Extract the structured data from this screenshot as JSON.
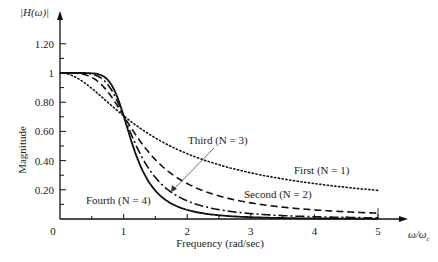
{
  "chart_data": {
    "type": "line",
    "title": "",
    "xlabel": "Frequency (rad/sec)",
    "xlabel_end": "ω/ω_c",
    "ylabel": "Magnitude",
    "ylabel_top": "|H(ω)|",
    "xlim": [
      0,
      5
    ],
    "ylim": [
      0,
      1.3
    ],
    "x_ticks": [
      "0",
      "1",
      "2",
      "3",
      "4",
      "5"
    ],
    "y_ticks": [
      "0.20",
      "0.40",
      "0.60",
      "0.80",
      "1",
      "1.20"
    ],
    "grid": false,
    "formula": "|H(ω)| = 1 / sqrt(1 + (ω/ω_c)^(2N))",
    "x": [
      0,
      0.25,
      0.5,
      0.75,
      1,
      1.25,
      1.5,
      2,
      2.5,
      3,
      4,
      5
    ],
    "series": [
      {
        "name": "First (N = 1)",
        "order": 1,
        "style": "dotted",
        "values": [
          1.0,
          0.97,
          0.894,
          0.8,
          0.707,
          0.625,
          0.555,
          0.447,
          0.371,
          0.316,
          0.243,
          0.196
        ]
      },
      {
        "name": "Second (N = 2)",
        "order": 2,
        "style": "dashed",
        "values": [
          1.0,
          0.998,
          0.97,
          0.872,
          0.707,
          0.539,
          0.406,
          0.243,
          0.158,
          0.11,
          0.062,
          0.04
        ]
      },
      {
        "name": "Third (N = 3)",
        "order": 3,
        "style": "dash-dot",
        "values": [
          1.0,
          1.0,
          0.992,
          0.922,
          0.707,
          0.456,
          0.284,
          0.124,
          0.064,
          0.037,
          0.016,
          0.008
        ]
      },
      {
        "name": "Fourth (N = 4)",
        "order": 4,
        "style": "solid",
        "values": [
          1.0,
          1.0,
          0.998,
          0.953,
          0.707,
          0.384,
          0.194,
          0.062,
          0.026,
          0.012,
          0.004,
          0.002
        ]
      }
    ],
    "annotations": [
      {
        "text": "First (N = 1)",
        "series": 0
      },
      {
        "text": "Second (N = 2)",
        "series": 1
      },
      {
        "text": "Third (N = 3)",
        "series": 2,
        "arrow": true
      },
      {
        "text": "Fourth (N = 4)",
        "series": 3
      }
    ]
  }
}
